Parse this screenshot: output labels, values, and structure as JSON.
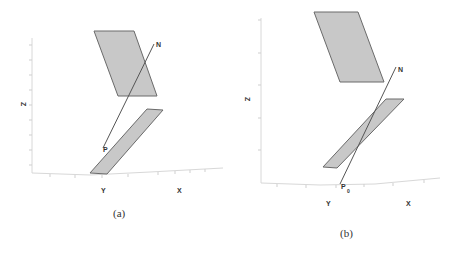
{
  "figure": {
    "panels": [
      {
        "id": "a",
        "caption": "(a)",
        "axis_labels": {
          "z": "Z",
          "y": "Y",
          "x": "X"
        },
        "point_labels": {
          "normal": "N",
          "point": "P"
        }
      },
      {
        "id": "b",
        "caption": "(b)",
        "axis_labels": {
          "z": "Z",
          "y": "Y",
          "x": "X"
        },
        "point_labels": {
          "normal": "N",
          "point": "P",
          "point_subscript": "0"
        }
      }
    ],
    "colors": {
      "plane_fill": "#c8c8c8",
      "plane_stroke": "#6a6a6a",
      "normal_line": "#555555",
      "axis": "#d8d8d8"
    }
  }
}
